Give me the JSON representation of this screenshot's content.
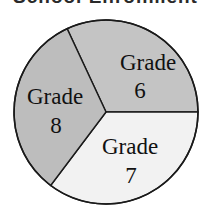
{
  "chart_data": {
    "type": "pie",
    "title": "School Enrollment",
    "slices": [
      {
        "label": "Grade 6",
        "line1": "Grade",
        "line2": "6",
        "start_deg": -115,
        "end_deg": 0,
        "percent": 32,
        "color": "#c4c4c4"
      },
      {
        "label": "Grade 7",
        "line1": "Grade",
        "line2": "7",
        "start_deg": 0,
        "end_deg": 127,
        "percent": 35,
        "color": "#f2f2f2"
      },
      {
        "label": "Grade 8",
        "line1": "Grade",
        "line2": "8",
        "start_deg": 127,
        "end_deg": 245,
        "percent": 33,
        "color": "#bdbdbd"
      }
    ],
    "legend": "none (labels inside slices)"
  }
}
